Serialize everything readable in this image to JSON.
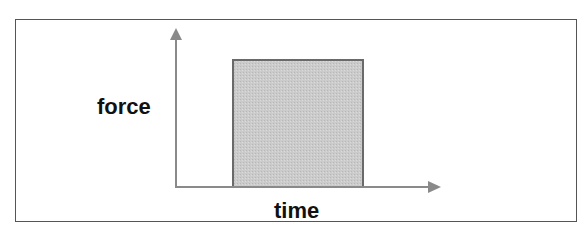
{
  "diagram": {
    "type": "force-time impulse graph",
    "y_axis_label": "force",
    "x_axis_label": "time",
    "shape": "rectangle (constant force over a time interval)"
  },
  "colors": {
    "axis": "#8a8a8a",
    "rect_fill": "#c8c8c8",
    "rect_stroke": "#6a6a6a",
    "frame": "#555555",
    "text": "#111111"
  }
}
